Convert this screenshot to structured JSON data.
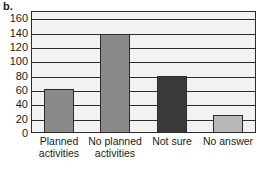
{
  "panel": {
    "label": "b."
  },
  "chart_data": {
    "type": "bar",
    "title": "",
    "subtitle": "",
    "xlabel": "",
    "ylabel": "",
    "categories": [
      "Planned\nactivities",
      "No planned\nactivities",
      "Not sure",
      "No answer"
    ],
    "values": [
      62,
      138,
      79,
      25
    ],
    "ylim": [
      0,
      170
    ],
    "yticks": [
      0,
      20,
      40,
      60,
      80,
      100,
      120,
      140,
      160
    ],
    "ytick_labels": [
      "0",
      "20",
      "40",
      "60",
      "80",
      "100",
      "120",
      "140",
      "160"
    ],
    "grid": true,
    "legend": "none",
    "bar_colors": [
      "#8a8a8a",
      "#8a8a8a",
      "#3a3a3a",
      "#b8b8b8"
    ],
    "plot_background": "#f2f2f2",
    "axis_color": "#2b2b2b"
  }
}
